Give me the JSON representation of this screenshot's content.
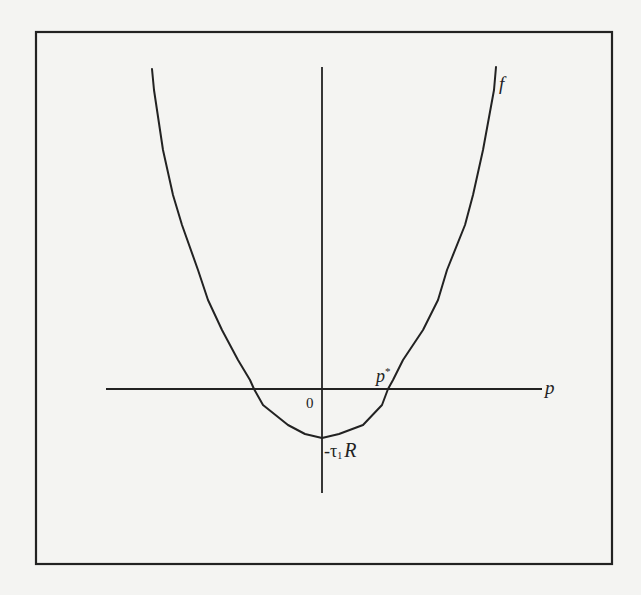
{
  "figure": {
    "frame": {
      "x": 36,
      "y": 32,
      "width": 576,
      "height": 532,
      "stroke": "#222222"
    },
    "axes": {
      "horizontal": {
        "x1": 106,
        "x2": 542,
        "y": 389,
        "label": "p"
      },
      "vertical": {
        "x": 322,
        "y1": 67,
        "y2": 493
      },
      "origin_label": "0"
    },
    "curve": {
      "name": "f",
      "label": "f",
      "stroke": "#222222",
      "points": [
        [
          152,
          69
        ],
        [
          154,
          90
        ],
        [
          163,
          150
        ],
        [
          173,
          195
        ],
        [
          182,
          225
        ],
        [
          198,
          270
        ],
        [
          208,
          300
        ],
        [
          222,
          330
        ],
        [
          238,
          360
        ],
        [
          250,
          380
        ],
        [
          254,
          389
        ],
        [
          263,
          405
        ],
        [
          288,
          425
        ],
        [
          305,
          434
        ],
        [
          322,
          438
        ],
        [
          339,
          434
        ],
        [
          355,
          428
        ],
        [
          363,
          425
        ],
        [
          382,
          405
        ],
        [
          388,
          389
        ],
        [
          393,
          380
        ],
        [
          403,
          360
        ],
        [
          423,
          330
        ],
        [
          438,
          300
        ],
        [
          447,
          270
        ],
        [
          465,
          225
        ],
        [
          473,
          195
        ],
        [
          483,
          150
        ],
        [
          494,
          90
        ],
        [
          496,
          67
        ]
      ]
    },
    "annotations": {
      "p_star": "p",
      "p_star_sup": "*",
      "intercept_prefix": "-τ",
      "intercept_sub": "1",
      "intercept_suffix": "R"
    }
  },
  "chart_data": {
    "type": "line",
    "title": "",
    "xlabel": "p",
    "ylabel": "",
    "series": [
      {
        "name": "f",
        "description": "U-shaped convex function of p with minimum at p = 0 equal to -τ1R, crossing zero at p*"
      }
    ],
    "annotations": [
      "0",
      "p*",
      "-τ1R",
      "f",
      "p"
    ],
    "grid": false,
    "legend": "none"
  }
}
